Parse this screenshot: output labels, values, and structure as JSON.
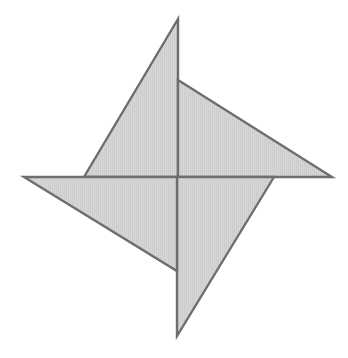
{
  "diagram": {
    "type": "pinwheel",
    "width": 348,
    "height": 358,
    "background": "#ffffff",
    "fill": "#d4d4d4",
    "stroke": "#6e6e6e",
    "center": [
      178,
      177
    ],
    "blades": [
      {
        "name": "top-blade",
        "points": "178,19 178,177 84,177"
      },
      {
        "name": "right-blade",
        "points": "178,80 332,177 178,177"
      },
      {
        "name": "bottom-blade",
        "points": "274,177 177,336 177,177"
      },
      {
        "name": "left-blade",
        "points": "24,177 177,177 177,271"
      }
    ]
  }
}
